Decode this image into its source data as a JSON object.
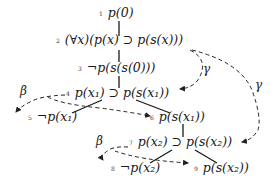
{
  "diagram": {
    "type": "tableau-proof-tree",
    "nodes": [
      {
        "id": 1,
        "num": "1",
        "formula": "p(0)"
      },
      {
        "id": 2,
        "num": "2",
        "formula": "(∀x)(p(x) ⊃ p(s(x)))"
      },
      {
        "id": 3,
        "num": "3",
        "formula": "¬p(s(s(0)))"
      },
      {
        "id": 4,
        "num": "4",
        "formula": "p(x₁) ⊃ p(s(x₁))"
      },
      {
        "id": 5,
        "num": "5",
        "formula": "¬p(x₁)"
      },
      {
        "id": 6,
        "num": "6",
        "formula": "p(s(x₁))"
      },
      {
        "id": 7,
        "num": "7",
        "formula": "p(x₂) ⊃ p(s(x₂))"
      },
      {
        "id": 8,
        "num": "8",
        "formula": "¬p(x₂)"
      },
      {
        "id": 9,
        "num": "9",
        "formula": "p(s(x₂))"
      }
    ],
    "edges": [
      {
        "from": 1,
        "to": 2
      },
      {
        "from": 2,
        "to": 3
      },
      {
        "from": 3,
        "to": 4
      },
      {
        "from": 4,
        "to": 5
      },
      {
        "from": 4,
        "to": 6
      },
      {
        "from": 6,
        "to": 7
      },
      {
        "from": 7,
        "to": 8
      },
      {
        "from": 7,
        "to": 9
      }
    ],
    "rule_arrows": [
      {
        "label": "γ",
        "from": 2,
        "to": 4,
        "style": "dashed"
      },
      {
        "label": "γ",
        "from": 2,
        "to": 7,
        "style": "dashed"
      },
      {
        "label": "β",
        "from": 4,
        "to": "5,6",
        "style": "dashed"
      },
      {
        "label": "β",
        "from": 7,
        "to": "8,9",
        "style": "dashed"
      }
    ],
    "labels": {
      "gamma1": "γ",
      "gamma2": "γ",
      "beta1": "β",
      "beta2": "β"
    }
  }
}
